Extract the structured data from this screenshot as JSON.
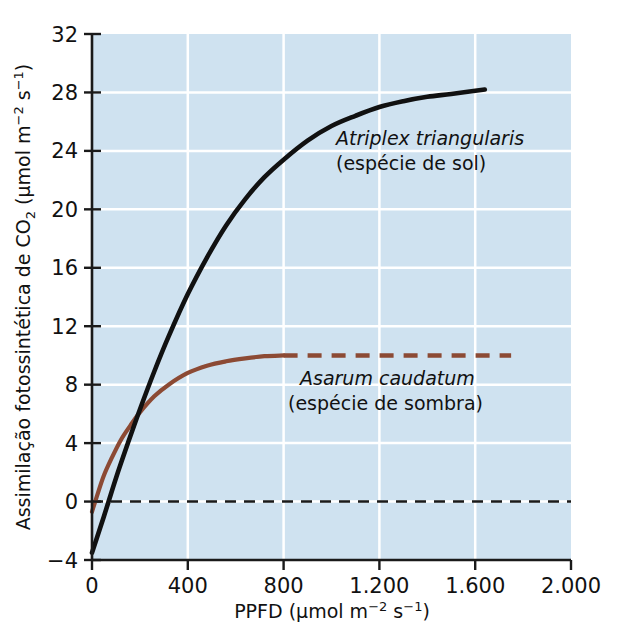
{
  "chart_data": {
    "type": "line",
    "title": "",
    "xlabel": "PPFD (µmol m−2 s−1)",
    "ylabel": "Assimilação fotossintética de CO₂ (µmol m−2 s−1)",
    "xlim": [
      0,
      2000
    ],
    "ylim": [
      -4,
      32
    ],
    "xticks": [
      "0",
      "400",
      "800",
      "1.200",
      "1.600",
      "2.000"
    ],
    "xtick_values": [
      0,
      400,
      800,
      1200,
      1600,
      2000
    ],
    "yticks": [
      "-4",
      "0",
      "4",
      "8",
      "12",
      "16",
      "20",
      "24",
      "28",
      "32"
    ],
    "ytick_values": [
      -4,
      0,
      4,
      8,
      12,
      16,
      20,
      24,
      28,
      32
    ],
    "grid": "white gridlines on light blue panel",
    "legend_position": "inline annotations",
    "zero_line": {
      "value": 0,
      "style": "dashed",
      "color": "#1a1a1a"
    },
    "series": [
      {
        "name": "Atriplex triangularis",
        "subtitle": "(espécie de sol)",
        "color": "#111111",
        "style": "solid",
        "x": [
          0,
          50,
          100,
          150,
          200,
          260,
          320,
          400,
          480,
          560,
          640,
          720,
          800,
          900,
          1000,
          1100,
          1200,
          1300,
          1400,
          1500,
          1640
        ],
        "y": [
          -3.5,
          -1.0,
          1.6,
          4.0,
          6.3,
          8.9,
          11.3,
          14.2,
          16.7,
          18.9,
          20.7,
          22.2,
          23.4,
          24.7,
          25.7,
          26.4,
          27.0,
          27.4,
          27.7,
          27.9,
          28.2
        ]
      },
      {
        "name": "Asarum caudatum",
        "subtitle": "(espécie de sombra)",
        "color": "#8c4a34",
        "style": "solid then dashed after 800",
        "x": [
          0,
          25,
          50,
          80,
          120,
          160,
          200,
          260,
          320,
          400,
          480,
          560,
          640,
          720,
          800
        ],
        "y": [
          -0.7,
          0.6,
          1.8,
          2.9,
          4.2,
          5.2,
          6.1,
          7.2,
          8.0,
          8.8,
          9.3,
          9.6,
          9.8,
          9.95,
          10.0
        ],
        "dashed_x": [
          800,
          1750
        ],
        "dashed_y": [
          10.0,
          10.0
        ]
      }
    ],
    "annotations": [
      {
        "name": "Atriplex triangularis",
        "subtitle": "(espécie de sol)",
        "x_px": 336,
        "y_px": 145
      },
      {
        "name": "Asarum caudatum",
        "subtitle": "(espécie de sombra)",
        "x_px": 300,
        "y_px": 385
      }
    ],
    "colors": {
      "panel": "#cfe2f0",
      "grid": "#ffffff",
      "sun_species": "#111111",
      "shade_species": "#8c4a34",
      "axis": "#1a1a1a",
      "text": "#111111"
    }
  },
  "axis": {
    "y_title_parts": {
      "main": "Assimilação fotossintética de CO",
      "sub2": "2",
      "unit_open": " (µmol m",
      "sup_minus2": "−2",
      "unit_s": " s",
      "sup_minus1": "−1",
      "unit_close": ")"
    },
    "x_title_parts": {
      "main": "PPFD (µmol m",
      "sup_minus2": "−2",
      "unit_s": " s",
      "sup_minus1": "−1",
      "unit_close": ")"
    }
  },
  "ticks": {
    "x": [
      "0",
      "400",
      "800",
      "1.200",
      "1.600",
      "2.000"
    ],
    "y": [
      "32",
      "28",
      "24",
      "20",
      "16",
      "12",
      "8",
      "4",
      "0",
      "−4"
    ]
  },
  "annotations": {
    "sun": {
      "species": "Atriplex triangularis",
      "sub": "(espécie de sol)"
    },
    "shade": {
      "species": "Asarum caudatum",
      "sub": "(espécie de sombra)"
    }
  }
}
